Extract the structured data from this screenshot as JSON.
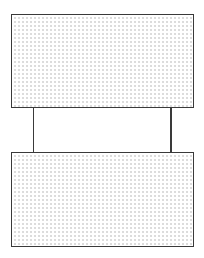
{
  "diagram": {
    "stroke_color": "#3a3a3a",
    "fill_dot_color": "#c9c9c9",
    "background": "#ffffff",
    "boxes": [
      {
        "id": "top-box",
        "x": 11,
        "y": 14,
        "width": 183,
        "height": 94,
        "fill": "dotted"
      },
      {
        "id": "bottom-box",
        "x": 11,
        "y": 152,
        "width": 183,
        "height": 95,
        "fill": "dotted"
      }
    ],
    "connectors": [
      {
        "id": "left-connector",
        "x": 33,
        "y1": 107,
        "y2": 153
      },
      {
        "id": "right-connector",
        "x": 170,
        "y1": 107,
        "y2": 153
      }
    ]
  }
}
